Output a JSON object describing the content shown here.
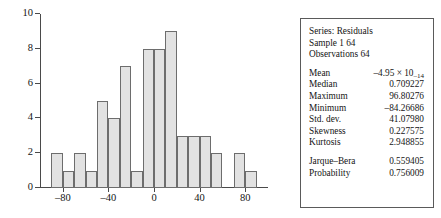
{
  "chart_data": {
    "type": "bar",
    "title": "",
    "xlabel": "",
    "ylabel": "",
    "grid": false,
    "legend": "none",
    "xlim": [
      -100,
      100
    ],
    "ylim": [
      0,
      10
    ],
    "bin_width": 10,
    "y_ticks": [
      "0",
      "2",
      "4",
      "6",
      "8",
      "10"
    ],
    "y_tick_values": [
      0,
      2,
      4,
      6,
      8,
      10
    ],
    "x_ticks": [
      "-80",
      "-40",
      "0",
      "40",
      "80"
    ],
    "x_tick_values": [
      -80,
      -40,
      0,
      40,
      80
    ],
    "categories": [
      "-90",
      "-80",
      "-70",
      "-60",
      "-50",
      "-40",
      "-30",
      "-20",
      "-10",
      "0",
      "10",
      "20",
      "30",
      "40",
      "50",
      "60",
      "70",
      "80"
    ],
    "bin_left_edges": [
      -90,
      -80,
      -70,
      -60,
      -50,
      -40,
      -30,
      -20,
      -10,
      0,
      10,
      20,
      30,
      40,
      50,
      60,
      70,
      80
    ],
    "values": [
      2,
      1,
      2,
      1,
      5,
      4,
      7,
      1,
      8,
      8,
      9,
      3,
      3,
      3,
      2,
      0,
      2,
      1
    ],
    "bar_fill": "#e2e2e2",
    "bar_edge": "#6d6d6d",
    "axis_color": "#4a4a4a"
  },
  "stats": {
    "header": [
      "Series: Residuals",
      "Sample 1 64",
      "Observations 64"
    ],
    "group1": [
      {
        "label": "Mean",
        "value": "-4.95 × 10",
        "exponent": "-14"
      },
      {
        "label": "Median",
        "value": "0.709227"
      },
      {
        "label": "Maximum",
        "value": "96.80276"
      },
      {
        "label": "Minimum",
        "value": "-84.26686"
      },
      {
        "label": "Std. dev.",
        "value": "41.07980"
      },
      {
        "label": "Skewness",
        "value": "0.227575"
      },
      {
        "label": "Kurtosis",
        "value": "2.948855"
      }
    ],
    "group2": [
      {
        "label": "Jarque-Bera",
        "value": "0.559405"
      },
      {
        "label": "Probability",
        "value": "0.756009"
      }
    ]
  }
}
